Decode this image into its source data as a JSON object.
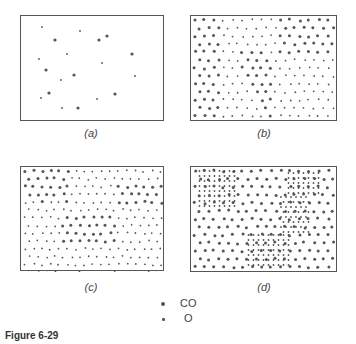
{
  "figure": {
    "title": "Figure 6-29",
    "panels": [
      {
        "id": "a",
        "caption": "(a)",
        "pattern": "sparse random CO and O adsorbates"
      },
      {
        "id": "b",
        "caption": "(b)",
        "pattern": "mixed domains of CO and O with ordered regions"
      },
      {
        "id": "c",
        "caption": "(c)",
        "pattern": "near-uniform hexagonal lattice with CO islands"
      },
      {
        "id": "d",
        "caption": "(d)",
        "pattern": "dense O domains separated by CO lattice bands"
      }
    ],
    "legend": [
      {
        "symbol": "large-dot",
        "label": "CO"
      },
      {
        "symbol": "small-dot",
        "label": "O"
      }
    ]
  },
  "colors": {
    "dot": "#555555",
    "border": "#555555"
  }
}
